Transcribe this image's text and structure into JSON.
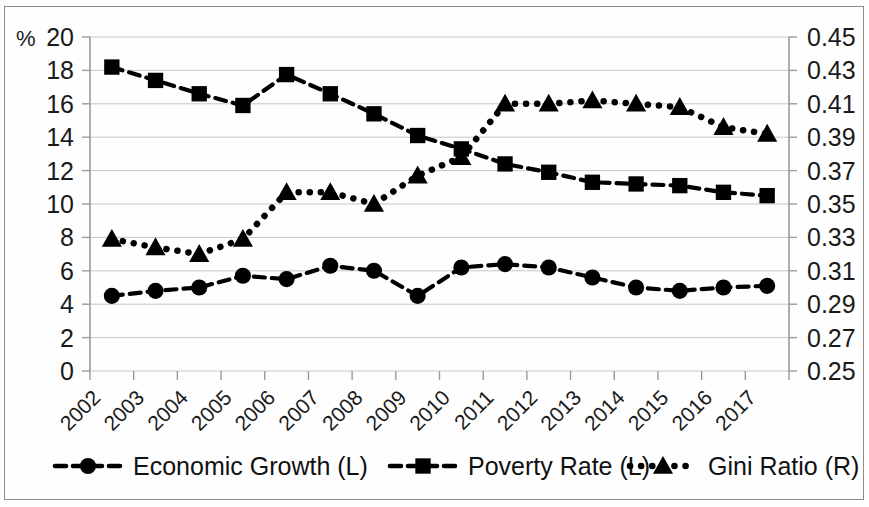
{
  "chart_data": {
    "type": "line",
    "title": "",
    "subtitle": "",
    "xlabel": "",
    "ylabel": "%",
    "y2label": "",
    "grid": true,
    "legend_position": "bottom",
    "categories": [
      "2002",
      "2003",
      "2004",
      "2005",
      "2006",
      "2007",
      "2008",
      "2009",
      "2010",
      "2011",
      "2012",
      "2013",
      "2014",
      "2015",
      "2016",
      "2017"
    ],
    "left_axis": {
      "label": "%",
      "min": 0,
      "max": 20,
      "step": 2,
      "ticks": [
        "0",
        "2",
        "4",
        "6",
        "8",
        "10",
        "12",
        "14",
        "16",
        "18",
        "20"
      ]
    },
    "right_axis": {
      "label": "",
      "min": 0.25,
      "max": 0.45,
      "step": 0.02,
      "ticks": [
        "0.25",
        "0.27",
        "0.29",
        "0.31",
        "0.33",
        "0.35",
        "0.37",
        "0.39",
        "0.41",
        "0.43",
        "0.45"
      ]
    },
    "series": [
      {
        "name": "Economic Growth (L)",
        "axis": "left",
        "marker": "circle",
        "line_style": "dashed",
        "color": "#000000",
        "values": [
          4.5,
          4.8,
          5.0,
          5.7,
          5.5,
          6.3,
          6.0,
          4.5,
          6.2,
          6.4,
          6.2,
          5.6,
          5.0,
          4.8,
          5.0,
          5.1
        ]
      },
      {
        "name": "Poverty Rate (L)",
        "axis": "left",
        "marker": "square",
        "line_style": "dashed",
        "color": "#000000",
        "values": [
          18.2,
          17.4,
          16.6,
          15.9,
          17.75,
          16.6,
          15.4,
          14.1,
          13.3,
          12.4,
          11.9,
          11.3,
          11.2,
          11.1,
          10.7,
          10.5
        ]
      },
      {
        "name": "Gini Ratio (R)",
        "axis": "right",
        "marker": "triangle",
        "line_style": "dotted",
        "color": "#000000",
        "values": [
          0.329,
          0.324,
          0.32,
          0.329,
          0.357,
          0.357,
          0.35,
          0.367,
          0.378,
          0.41,
          0.41,
          0.412,
          0.41,
          0.408,
          0.396,
          0.392
        ]
      }
    ]
  },
  "legend": {
    "items": [
      {
        "label": "Economic Growth (L)",
        "marker": "circle",
        "style": "dashed"
      },
      {
        "label": "Poverty Rate (L)",
        "marker": "square",
        "style": "dashed"
      },
      {
        "label": "Gini Ratio (R)",
        "marker": "triangle",
        "style": "dotted"
      }
    ]
  }
}
